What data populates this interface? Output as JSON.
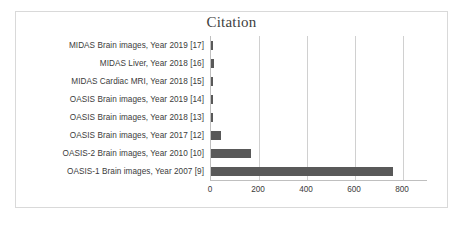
{
  "chart_data": {
    "type": "bar",
    "orientation": "horizontal",
    "title": "Citation",
    "xlabel": "",
    "ylabel": "",
    "xlim": [
      0,
      900
    ],
    "grid": true,
    "legend": false,
    "bar_color": "#595959",
    "gridline_color": "#d0d0d0",
    "axis_color": "#bfbfbf",
    "xticks": [
      0,
      200,
      400,
      600,
      800
    ],
    "xtick_labels": [
      "0",
      "200",
      "400",
      "600",
      "800"
    ],
    "categories": [
      "MIDAS Brain images, Year 2019 [17]",
      "MIDAS Liver, Year 2018 [16]",
      "MIDAS Cardiac MRI, Year 2018 [15]",
      "OASIS Brain images, Year 2019 [14]",
      "OASIS Brain images, Year 2018 [13]",
      "OASIS Brain images, Year 2017 [12]",
      "OASIS-2 Brain images, Year 2010 [10]",
      "OASIS-1 Brain images, Year 2007 [9]"
    ],
    "values": [
      10,
      14,
      8,
      3,
      3,
      43,
      165,
      760
    ],
    "series": [
      {
        "name": "Citation",
        "values": [
          10,
          14,
          8,
          3,
          3,
          43,
          165,
          760
        ]
      }
    ]
  }
}
